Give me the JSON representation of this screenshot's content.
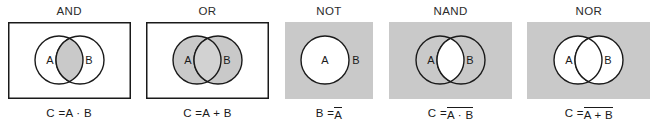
{
  "figure": {
    "background_color": "#ffffff",
    "shade_color": "#c9c9c9",
    "lens_light_color": "#d2d2d2",
    "white_color": "#ffffff",
    "stroke_color": "#1a1a1a",
    "text_color": "#1a1a1a"
  },
  "panels": [
    {
      "key": "and",
      "title": "AND",
      "frame": "rect-outline",
      "label_a": "A",
      "label_b": "B",
      "label_b_inside": true,
      "fill_rect": "#ffffff",
      "fill_circle_a": "#ffffff",
      "fill_circle_b": "#ffffff",
      "fill_lens": "#c9c9c9",
      "formula": "C = A · B",
      "formula_parts": [
        {
          "text": "C = ",
          "overbar": false
        },
        {
          "text": "A · B",
          "overbar": false
        }
      ]
    },
    {
      "key": "or",
      "title": "OR",
      "frame": "rect-outline",
      "label_a": "A",
      "label_b": "B",
      "label_b_inside": true,
      "fill_rect": "#ffffff",
      "fill_circle_a": "#c9c9c9",
      "fill_circle_b": "#c9c9c9",
      "fill_lens": "#d2d2d2",
      "formula": "C = A + B",
      "formula_parts": [
        {
          "text": "C = ",
          "overbar": false
        },
        {
          "text": "A + B",
          "overbar": false
        }
      ]
    },
    {
      "key": "not",
      "title": "NOT",
      "frame": "rect-filled",
      "label_a": "A",
      "label_b": "B",
      "label_b_inside": false,
      "single_circle": true,
      "fill_rect": "#c9c9c9",
      "fill_circle_a": "#ffffff",
      "fill_circle_b": "#c9c9c9",
      "fill_lens": "#ffffff",
      "formula": "B = A̅",
      "formula_parts": [
        {
          "text": "B = ",
          "overbar": false
        },
        {
          "text": "A",
          "overbar": true
        }
      ]
    },
    {
      "key": "nand",
      "title": "NAND",
      "frame": "rect-filled",
      "label_a": "A",
      "label_b": "B",
      "label_b_inside": true,
      "fill_rect": "#c9c9c9",
      "fill_circle_a": "#c9c9c9",
      "fill_circle_b": "#c9c9c9",
      "fill_lens": "#ffffff",
      "formula": "C = A · B (overbar)",
      "formula_parts": [
        {
          "text": "C = ",
          "overbar": false
        },
        {
          "text": "A · B",
          "overbar": true
        }
      ]
    },
    {
      "key": "nor",
      "title": "NOR",
      "frame": "rect-filled",
      "label_a": "A",
      "label_b": "B",
      "label_b_inside": true,
      "fill_rect": "#c9c9c9",
      "fill_circle_a": "#ffffff",
      "fill_circle_b": "#ffffff",
      "fill_lens": "#ffffff",
      "formula": "C = A + B (overbar)",
      "formula_parts": [
        {
          "text": "C = ",
          "overbar": false
        },
        {
          "text": "A + B",
          "overbar": true
        }
      ]
    }
  ],
  "geometry": {
    "panel_width": 123,
    "panel_height": 77,
    "not_panel_width": 88,
    "circle_radius": 24,
    "circle_cx_a": 51,
    "circle_cx_b": 72,
    "circle_cy": 38,
    "not_circle_cx": 40,
    "not_label_b_x": 71
  }
}
